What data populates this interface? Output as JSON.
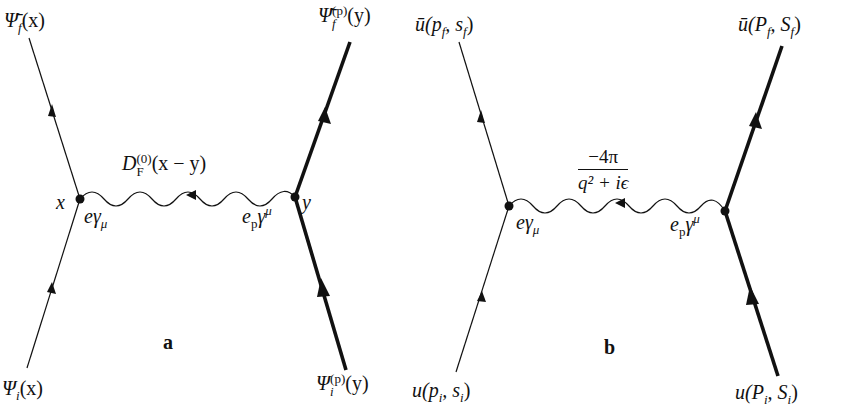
{
  "figure": {
    "diagrams": [
      {
        "id": "a",
        "panel_label": "a",
        "left_top_label": "Ψ̄_f(x)",
        "right_top_label": "Ψ̄_f^(p)(y)",
        "left_bottom_label": "Ψ_i(x)",
        "right_bottom_label": "Ψ_i^(p)(y)",
        "propagator_label": "D_F^(0)(x − y)",
        "left_vertex_label": "x",
        "right_vertex_label": "y",
        "left_coupling": "eγ_μ",
        "right_coupling": "e_p γ^μ"
      },
      {
        "id": "b",
        "panel_label": "b",
        "left_top_label": "ū(p_f, s_f)",
        "right_top_label": "ū(P_f, S_f)",
        "left_bottom_label": "u(p_i, s_i)",
        "right_bottom_label": "u(P_i, S_i)",
        "propagator_numerator": "−4π",
        "propagator_denominator": "q² + iϵ",
        "left_coupling": "eγ_μ",
        "right_coupling": "e_p γ^μ"
      }
    ],
    "line_color": "#111111"
  },
  "text": {
    "a_ltop_main": "Ψ̄",
    "a_ltop_sub": "f",
    "a_ltop_arg": "(x)",
    "a_rtop_main": "Ψ̄",
    "a_rtop_sub": "f",
    "a_rtop_sup": "(p)",
    "a_rtop_arg": "(y)",
    "a_lbot_main": "Ψ",
    "a_lbot_sub": "i",
    "a_lbot_arg": "(x)",
    "a_rbot_main": "Ψ",
    "a_rbot_sub": "i",
    "a_rbot_sup": "(p)",
    "a_rbot_arg": "(y)",
    "a_prop_main": "D",
    "a_prop_sub": "F",
    "a_prop_sup": "(0)",
    "a_prop_arg": "(x − y)",
    "a_vx": "x",
    "a_vy": "y",
    "a_lc_main": "eγ",
    "a_lc_sub": "μ",
    "a_rc_e": "e",
    "a_rc_sub": "p",
    "a_rc_g": "γ",
    "a_rc_sup": "μ",
    "a_panel": "a",
    "b_ltop": "ū(p",
    "b_ltop_sub1": "f",
    "b_ltop_mid": ", s",
    "b_ltop_sub2": "f",
    "b_ltop_end": ")",
    "b_rtop": "ū(P",
    "b_rtop_sub1": "f",
    "b_rtop_mid": ", S",
    "b_rtop_sub2": "f",
    "b_rtop_end": ")",
    "b_lbot": "u(p",
    "b_lbot_sub1": "i",
    "b_lbot_mid": ", s",
    "b_lbot_sub2": "i",
    "b_lbot_end": ")",
    "b_rbot": "u(P",
    "b_rbot_sub1": "i",
    "b_rbot_mid": ", S",
    "b_rbot_sub2": "i",
    "b_rbot_end": ")",
    "b_num": "−4π",
    "b_den": "q² + iϵ",
    "b_lc_main": "eγ",
    "b_lc_sub": "μ",
    "b_rc_e": "e",
    "b_rc_sub": "p",
    "b_rc_g": "γ",
    "b_rc_sup": "μ",
    "b_panel": "b"
  }
}
